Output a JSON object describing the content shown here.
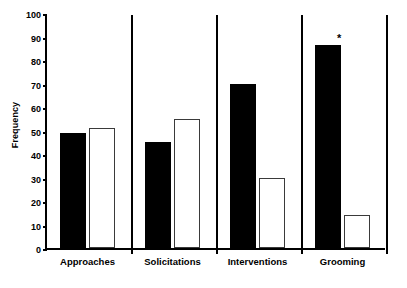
{
  "chart_data": {
    "type": "bar",
    "title": "",
    "xlabel": "",
    "ylabel": "Frequency",
    "ylim": [
      0,
      100
    ],
    "yticks": [
      0,
      10,
      20,
      30,
      40,
      50,
      60,
      70,
      80,
      90,
      100
    ],
    "grid": false,
    "legend": "none",
    "categories": [
      "Approaches",
      "Solicitations",
      "Interventions",
      "Grooming"
    ],
    "series": [
      {
        "name": "filled",
        "values": [
          49,
          45,
          70,
          86.5
        ]
      },
      {
        "name": "open",
        "values": [
          51,
          55,
          30,
          14
        ]
      }
    ],
    "annotations": [
      {
        "category": "Grooming",
        "series": "filled",
        "text": "*"
      }
    ]
  },
  "axis": {
    "y_title": "Frequency",
    "tick_labels": [
      "100",
      "90",
      "80",
      "70",
      "60",
      "50",
      "40",
      "30",
      "20",
      "10",
      "0"
    ]
  }
}
